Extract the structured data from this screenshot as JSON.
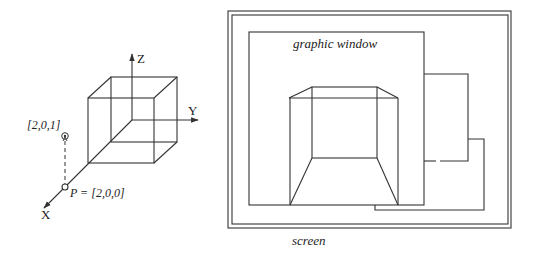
{
  "left_figure": {
    "axes": {
      "x_label": "X",
      "y_label": "Y",
      "z_label": "Z"
    },
    "points": [
      {
        "label": "P = [2,0,0]",
        "name": "P"
      },
      {
        "label": "[2,0,1]",
        "name": "elevated-point"
      }
    ]
  },
  "right_figure": {
    "graphic_window_label": "graphic window",
    "screen_label": "screen"
  },
  "colors": {
    "line": "#333333",
    "background": "#ffffff"
  }
}
